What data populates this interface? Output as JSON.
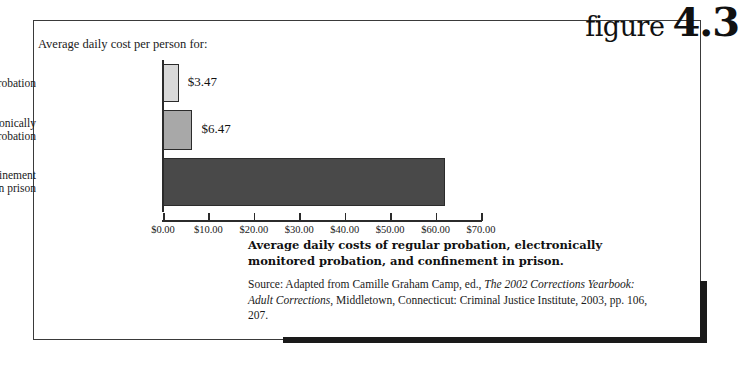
{
  "figure": {
    "word": "figure",
    "number": "4.3"
  },
  "chart_data": {
    "type": "bar",
    "orientation": "horizontal",
    "title": "Average daily cost per person for:",
    "categories": [
      "Regular probation",
      "Electronically monitored probation",
      "Confinement in prison"
    ],
    "category_lines": [
      [
        "Regular probation"
      ],
      [
        "Electronically",
        "monitored probation"
      ],
      [
        "Confinement",
        "in prison"
      ]
    ],
    "values": [
      3.47,
      6.47,
      62.05
    ],
    "value_labels": [
      "$3.47",
      "$6.47",
      ""
    ],
    "bar_colors": [
      "#d9d9d9",
      "#a8a8a8",
      "#494949"
    ],
    "xlabel": "",
    "ylabel": "",
    "xlim": [
      0,
      70
    ],
    "xticks": [
      0,
      10,
      20,
      30,
      40,
      50,
      60,
      70
    ],
    "xtick_labels": [
      "$0.00",
      "$10.00",
      "$20.00",
      "$30.00",
      "$40.00",
      "$50.00",
      "$60.00",
      "$70.00"
    ],
    "grid": false,
    "legend": false
  },
  "caption": {
    "title": "Average daily costs of regular probation, electronically monitored probation, and confinement in prison.",
    "source_prefix": "Source: Adapted from Camille Graham Camp, ed., ",
    "source_italic_1": "The 2002 Corrections Yearbook: Adult Corrections",
    "source_suffix": ", Middletown, Connecticut: Criminal Justice Institute, 2003, pp. 106, 207."
  }
}
